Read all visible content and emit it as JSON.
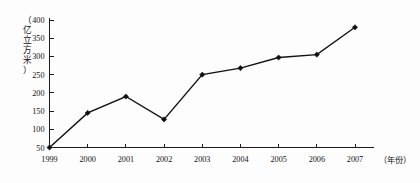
{
  "chart_data": {
    "type": "line",
    "title": "",
    "subtitle": "",
    "xlabel": "（年份）",
    "ylabel": "（亿立方米）",
    "categories": [
      "1999",
      "2000",
      "2001",
      "2002",
      "2003",
      "2004",
      "2005",
      "2006",
      "2007"
    ],
    "values": [
      50,
      145,
      190,
      127,
      250,
      268,
      297,
      305,
      380
    ],
    "series": [
      {
        "name": "",
        "values": [
          50,
          145,
          190,
          127,
          250,
          268,
          297,
          305,
          380
        ]
      }
    ],
    "ylim": [
      50,
      400
    ],
    "xlim": [
      "1999",
      "2007"
    ],
    "y_ticks": [
      "50",
      "100",
      "150",
      "200",
      "250",
      "300",
      "350",
      "400"
    ],
    "y_tick_values": [
      50,
      100,
      150,
      200,
      250,
      300,
      350,
      400
    ],
    "x_ticks": [
      "1999",
      "2000",
      "2001",
      "2002",
      "2003",
      "2004",
      "2005",
      "2006",
      "2007"
    ],
    "grid": false,
    "legend": null,
    "legend_position": "none",
    "marker": "diamond",
    "line_color": "#111111",
    "marker_color": "#111111",
    "axis_color": "#1a1a1a",
    "background_color": "#fdfdfd",
    "annotations": []
  },
  "axis": {
    "y_unit_label": "（亿立方米）",
    "y_unit_chars": [
      "（",
      "亿",
      "立",
      "方",
      "米",
      "）"
    ],
    "x_unit_label": "（年份）"
  }
}
